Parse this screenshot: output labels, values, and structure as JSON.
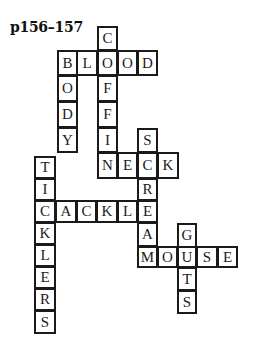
{
  "title": "p156–157",
  "cell_border_color": "#1a1a1a",
  "cells": [
    {
      "letter": "C",
      "x": 97,
      "y": 26,
      "w": 21,
      "h": 25,
      "word": "COFFIN"
    },
    {
      "letter": "B",
      "x": 57,
      "y": 50,
      "w": 21,
      "h": 26,
      "word": "BLOOD/BODY"
    },
    {
      "letter": "L",
      "x": 76,
      "y": 50,
      "w": 22,
      "h": 26,
      "word": "BLOOD"
    },
    {
      "letter": "O",
      "x": 97,
      "y": 50,
      "w": 21,
      "h": 26,
      "word": "BLOOD/COFFIN"
    },
    {
      "letter": "O",
      "x": 117,
      "y": 50,
      "w": 21,
      "h": 26,
      "word": "BLOOD"
    },
    {
      "letter": "D",
      "x": 137,
      "y": 50,
      "w": 21,
      "h": 26,
      "word": "BLOOD"
    },
    {
      "letter": "O",
      "x": 57,
      "y": 75,
      "w": 21,
      "h": 27,
      "word": "BODY"
    },
    {
      "letter": "F",
      "x": 97,
      "y": 75,
      "w": 21,
      "h": 27,
      "word": "COFFIN"
    },
    {
      "letter": "D",
      "x": 57,
      "y": 101,
      "w": 21,
      "h": 27,
      "word": "BODY"
    },
    {
      "letter": "F",
      "x": 97,
      "y": 101,
      "w": 21,
      "h": 27,
      "word": "COFFIN"
    },
    {
      "letter": "Y",
      "x": 57,
      "y": 127,
      "w": 21,
      "h": 26,
      "word": "BODY"
    },
    {
      "letter": "I",
      "x": 97,
      "y": 127,
      "w": 21,
      "h": 26,
      "word": "COFFIN"
    },
    {
      "letter": "S",
      "x": 137,
      "y": 128,
      "w": 21,
      "h": 25,
      "word": "SCREAM"
    },
    {
      "letter": "N",
      "x": 97,
      "y": 152,
      "w": 21,
      "h": 27,
      "word": "COFFIN/NECK"
    },
    {
      "letter": "E",
      "x": 117,
      "y": 152,
      "w": 21,
      "h": 27,
      "word": "NECK"
    },
    {
      "letter": "C",
      "x": 137,
      "y": 152,
      "w": 21,
      "h": 27,
      "word": "NECK/SCREAM"
    },
    {
      "letter": "K",
      "x": 157,
      "y": 152,
      "w": 22,
      "h": 27,
      "word": "NECK"
    },
    {
      "letter": "T",
      "x": 34,
      "y": 156,
      "w": 22,
      "h": 23,
      "word": "TICKLERS"
    },
    {
      "letter": "I",
      "x": 34,
      "y": 178,
      "w": 22,
      "h": 23,
      "word": "TICKLERS"
    },
    {
      "letter": "R",
      "x": 137,
      "y": 178,
      "w": 21,
      "h": 23,
      "word": "SCREAM"
    },
    {
      "letter": "C",
      "x": 34,
      "y": 200,
      "w": 22,
      "h": 23,
      "word": "TICKLERS/CACKLE"
    },
    {
      "letter": "A",
      "x": 55,
      "y": 200,
      "w": 22,
      "h": 23,
      "word": "CACKLE"
    },
    {
      "letter": "C",
      "x": 76,
      "y": 200,
      "w": 21,
      "h": 23,
      "word": "CACKLE"
    },
    {
      "letter": "K",
      "x": 96,
      "y": 200,
      "w": 22,
      "h": 23,
      "word": "CACKLE"
    },
    {
      "letter": "L",
      "x": 117,
      "y": 200,
      "w": 21,
      "h": 23,
      "word": "CACKLE"
    },
    {
      "letter": "E",
      "x": 137,
      "y": 200,
      "w": 21,
      "h": 23,
      "word": "CACKLE/SCREAM"
    },
    {
      "letter": "K",
      "x": 34,
      "y": 222,
      "w": 22,
      "h": 23,
      "word": "TICKLERS"
    },
    {
      "letter": "A",
      "x": 137,
      "y": 222,
      "w": 21,
      "h": 25,
      "word": "SCREAM"
    },
    {
      "letter": "G",
      "x": 177,
      "y": 223,
      "w": 20,
      "h": 25,
      "word": "GUTS"
    },
    {
      "letter": "L",
      "x": 34,
      "y": 244,
      "w": 22,
      "h": 23,
      "word": "TICKLERS"
    },
    {
      "letter": "M",
      "x": 137,
      "y": 246,
      "w": 21,
      "h": 22,
      "word": "SCREAM/MOUSE"
    },
    {
      "letter": "O",
      "x": 157,
      "y": 246,
      "w": 21,
      "h": 22,
      "word": "MOUSE"
    },
    {
      "letter": "U",
      "x": 177,
      "y": 246,
      "w": 20,
      "h": 22,
      "word": "MOUSE/GUTS"
    },
    {
      "letter": "S",
      "x": 196,
      "y": 246,
      "w": 22,
      "h": 22,
      "word": "MOUSE"
    },
    {
      "letter": "E",
      "x": 217,
      "y": 246,
      "w": 21,
      "h": 22,
      "word": "MOUSE"
    },
    {
      "letter": "E",
      "x": 34,
      "y": 266,
      "w": 22,
      "h": 23,
      "word": "TICKLERS"
    },
    {
      "letter": "T",
      "x": 177,
      "y": 267,
      "w": 20,
      "h": 24,
      "word": "GUTS"
    },
    {
      "letter": "R",
      "x": 34,
      "y": 288,
      "w": 22,
      "h": 23,
      "word": "TICKLERS"
    },
    {
      "letter": "S",
      "x": 177,
      "y": 290,
      "w": 20,
      "h": 24,
      "word": "GUTS"
    },
    {
      "letter": "S",
      "x": 34,
      "y": 310,
      "w": 22,
      "h": 24,
      "word": "TICKLERS"
    }
  ],
  "words": {
    "across": [
      "BLOOD",
      "NECK",
      "CACKLE",
      "MOUSE"
    ],
    "down": [
      "COFFIN",
      "BODY",
      "SCREAM",
      "TICKLERS",
      "GUTS"
    ]
  }
}
